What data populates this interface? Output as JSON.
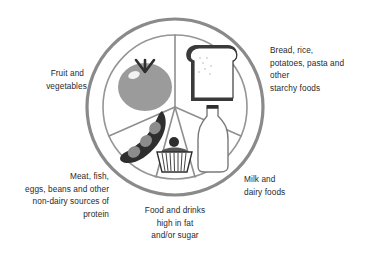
{
  "diagram": {
    "type": "food-plate",
    "colors": {
      "ring": "#8a8a8a",
      "divider": "#8f8f8f",
      "tomato": "#9b9b9b",
      "dark": "#2e2e2e",
      "text": "#2a2a2a"
    },
    "sections": [
      {
        "id": "fruit-veg",
        "icon": "tomato-icon",
        "label_lines": [
          "Fruit and",
          "vegetables"
        ]
      },
      {
        "id": "starchy",
        "icon": "bread-slice-icon",
        "label_lines": [
          "Bread, rice,",
          "potatoes, pasta and",
          "other",
          "starchy foods"
        ]
      },
      {
        "id": "protein",
        "icon": "pea-pod-icon",
        "label_lines": [
          "Meat, fish,",
          "eggs, beans and other",
          "non-dairy sources of",
          "protein"
        ]
      },
      {
        "id": "fat-sugar",
        "icon": "cupcake-icon",
        "label_lines": [
          "Food and drinks",
          "high in fat",
          "and/or sugar"
        ]
      },
      {
        "id": "dairy",
        "icon": "milk-bottle-icon",
        "label_lines": [
          "Milk and",
          "dairy foods"
        ]
      }
    ]
  }
}
